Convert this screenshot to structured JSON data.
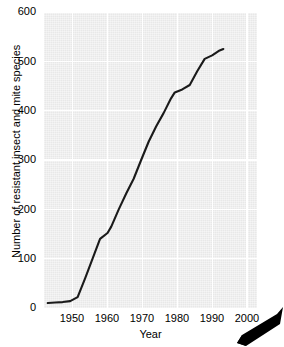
{
  "chart_data": {
    "type": "line",
    "title": "",
    "xlabel": "Year",
    "ylabel": "Number of resistant insect and mite species",
    "xlim": [
      1945,
      2002
    ],
    "ylim": [
      0,
      600
    ],
    "xticks": [
      1950,
      1960,
      1970,
      1980,
      1990,
      2000
    ],
    "yticks": [
      0,
      100,
      200,
      300,
      400,
      500,
      600
    ],
    "grid": true,
    "legend": null,
    "series": [
      {
        "name": "Resistant insect and mite species",
        "color": "#1a1a1a",
        "x": [
          1946,
          1948,
          1950,
          1952,
          1954,
          1956,
          1958,
          1960,
          1962,
          1963,
          1965,
          1967,
          1969,
          1971,
          1973,
          1975,
          1977,
          1979,
          1980,
          1982,
          1984,
          1986,
          1988,
          1990,
          1992,
          1993
        ],
        "y": [
          10,
          11,
          12,
          14,
          22,
          60,
          100,
          140,
          152,
          165,
          200,
          232,
          262,
          300,
          337,
          368,
          395,
          425,
          437,
          443,
          452,
          480,
          505,
          512,
          522,
          525
        ]
      }
    ],
    "grid_color": "#ffffff",
    "panel_color": "#e8e8e8",
    "axis_text_color": "#000000"
  },
  "axes": {
    "y_tick_labels": [
      "600",
      "500",
      "400",
      "300",
      "200",
      "100",
      "0"
    ],
    "x_tick_labels": [
      "1950",
      "1960",
      "1970",
      "1980",
      "1990",
      "2000"
    ],
    "x_title": "Year",
    "y_title": "Number of resistant insect and mite species"
  },
  "decoration": {
    "pointer_name": "arrow-pointer",
    "pointer_color": "#000000"
  }
}
